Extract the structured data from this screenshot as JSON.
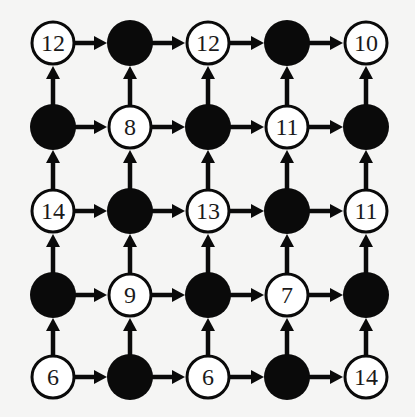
{
  "diagram": {
    "type": "grid-directed-graph",
    "rows": 5,
    "cols": 5,
    "edge_directions": [
      "right",
      "up"
    ],
    "colors": {
      "background": "#f5f5f4",
      "ink": "#0a0a0a",
      "open_fill": "#ffffff"
    },
    "layout": {
      "col_x": [
        53,
        130,
        208,
        287,
        366
      ],
      "row_y": [
        43,
        127,
        211,
        295,
        377
      ],
      "radius": 22
    },
    "nodes": [
      [
        {
          "filled": false,
          "label": "12"
        },
        {
          "filled": true,
          "label": ""
        },
        {
          "filled": false,
          "label": "12"
        },
        {
          "filled": true,
          "label": ""
        },
        {
          "filled": false,
          "label": "10"
        }
      ],
      [
        {
          "filled": true,
          "label": ""
        },
        {
          "filled": false,
          "label": "8"
        },
        {
          "filled": true,
          "label": ""
        },
        {
          "filled": false,
          "label": "11"
        },
        {
          "filled": true,
          "label": ""
        }
      ],
      [
        {
          "filled": false,
          "label": "14"
        },
        {
          "filled": true,
          "label": ""
        },
        {
          "filled": false,
          "label": "13"
        },
        {
          "filled": true,
          "label": ""
        },
        {
          "filled": false,
          "label": "11"
        }
      ],
      [
        {
          "filled": true,
          "label": ""
        },
        {
          "filled": false,
          "label": "9"
        },
        {
          "filled": true,
          "label": ""
        },
        {
          "filled": false,
          "label": "7"
        },
        {
          "filled": true,
          "label": ""
        }
      ],
      [
        {
          "filled": false,
          "label": "6"
        },
        {
          "filled": true,
          "label": ""
        },
        {
          "filled": false,
          "label": "6"
        },
        {
          "filled": true,
          "label": ""
        },
        {
          "filled": false,
          "label": "14"
        }
      ]
    ]
  }
}
